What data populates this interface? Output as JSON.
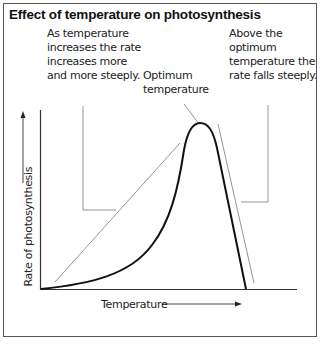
{
  "title": "Effect of temperature on photosynthesis",
  "annotations": {
    "rising": [
      "As temperature",
      "increases the rate",
      "increases more",
      "and more steeply."
    ],
    "optimum": [
      "Optimum",
      "temperature"
    ],
    "falling": [
      "Above the",
      "optimum",
      "temperature the",
      "rate falls steeply."
    ]
  },
  "axes": {
    "x_label": "Temperature",
    "y_label": "Rate of photosynthesis"
  },
  "colors": {
    "curve": "#111111",
    "annotation_lines": "#777777",
    "border": "#555555"
  }
}
